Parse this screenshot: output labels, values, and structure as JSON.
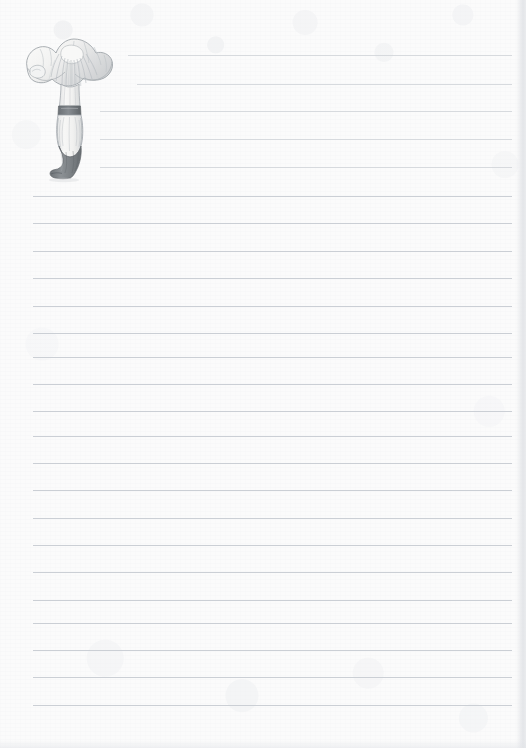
{
  "page": {
    "kind": "lined-notepaper",
    "width_px": 526,
    "height_px": 748,
    "paper_color": "#fbfbfb",
    "rule_color": "#c7cbd1",
    "text_content": "",
    "aria_label": "Blank lined notepaper with a pencil-drawn chanterelle mushroom illustration in the upper left corner"
  },
  "illustration": {
    "name": "chanterelle-mushroom",
    "style": "graphite pencil botanical sketch",
    "palette": {
      "outline": "#9aa0a6",
      "cap_fill": "#f4f4f3",
      "cap_shade": "#d9dbdd",
      "gill_line": "#b9bdc2",
      "stem_fill": "#f2f2f1",
      "ring_band": "#7d8288",
      "base_boot": "#808589"
    },
    "parts": [
      {
        "label": "cap",
        "description": "wavy funnel-shaped cap with radial gill ridges"
      },
      {
        "label": "gills",
        "description": "fine radial lines running down from cap center"
      },
      {
        "label": "ring",
        "description": "dark horizontal band around upper stem"
      },
      {
        "label": "stem",
        "description": "pale bulbous lower stem with vertical shading lines"
      },
      {
        "label": "base",
        "description": "dark grey boot-shaped base angled to the left"
      }
    ]
  },
  "ruled_lines": {
    "count": 24,
    "spacing_px": 27.4,
    "full_left_px": 33,
    "full_right_px": 512,
    "lines": [
      {
        "index": 1,
        "y": 55,
        "x1": 128,
        "x2": 512,
        "indented": true
      },
      {
        "index": 2,
        "y": 84,
        "x1": 137,
        "x2": 512,
        "indented": true
      },
      {
        "index": 3,
        "y": 111,
        "x1": 100,
        "x2": 512,
        "indented": true
      },
      {
        "index": 4,
        "y": 139,
        "x1": 100,
        "x2": 512,
        "indented": true
      },
      {
        "index": 5,
        "y": 167,
        "x1": 100,
        "x2": 512,
        "indented": true
      },
      {
        "index": 6,
        "y": 196,
        "x1": 33,
        "x2": 512,
        "indented": false
      },
      {
        "index": 7,
        "y": 223,
        "x1": 33,
        "x2": 512,
        "indented": false
      },
      {
        "index": 8,
        "y": 251,
        "x1": 33,
        "x2": 512,
        "indented": false
      },
      {
        "index": 9,
        "y": 278,
        "x1": 33,
        "x2": 512,
        "indented": false
      },
      {
        "index": 10,
        "y": 306,
        "x1": 33,
        "x2": 512,
        "indented": false
      },
      {
        "index": 11,
        "y": 333,
        "x1": 33,
        "x2": 512,
        "indented": false
      },
      {
        "index": 12,
        "y": 357,
        "x1": 33,
        "x2": 512,
        "indented": false
      },
      {
        "index": 13,
        "y": 384,
        "x1": 33,
        "x2": 512,
        "indented": false
      },
      {
        "index": 14,
        "y": 411,
        "x1": 33,
        "x2": 512,
        "indented": false
      },
      {
        "index": 15,
        "y": 436,
        "x1": 33,
        "x2": 512,
        "indented": false
      },
      {
        "index": 16,
        "y": 463,
        "x1": 33,
        "x2": 512,
        "indented": false
      },
      {
        "index": 17,
        "y": 490,
        "x1": 33,
        "x2": 512,
        "indented": false
      },
      {
        "index": 18,
        "y": 518,
        "x1": 33,
        "x2": 512,
        "indented": false
      },
      {
        "index": 19,
        "y": 545,
        "x1": 33,
        "x2": 512,
        "indented": false
      },
      {
        "index": 20,
        "y": 572,
        "x1": 33,
        "x2": 512,
        "indented": false
      },
      {
        "index": 21,
        "y": 600,
        "x1": 33,
        "x2": 512,
        "indented": false
      },
      {
        "index": 22,
        "y": 623,
        "x1": 33,
        "x2": 512,
        "indented": false
      },
      {
        "index": 23,
        "y": 650,
        "x1": 33,
        "x2": 512,
        "indented": false
      },
      {
        "index": 24,
        "y": 677,
        "x1": 33,
        "x2": 512,
        "indented": false
      },
      {
        "index": 25,
        "y": 705,
        "x1": 33,
        "x2": 512,
        "indented": false
      }
    ]
  }
}
